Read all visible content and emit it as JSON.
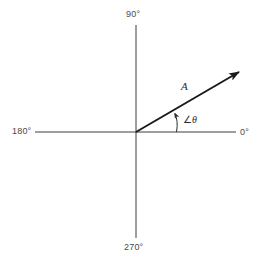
{
  "figure": {
    "name": "phasor-diagram",
    "background_color": "#ffffff",
    "width": 264,
    "height": 267
  },
  "axes": {
    "line_color": "#3d3d3d",
    "origin": {
      "x": 136,
      "y": 132
    },
    "vertical": {
      "x": 136,
      "y_top": 25,
      "y_bottom": 238
    },
    "horizontal": {
      "y": 132,
      "x_left": 35,
      "x_right": 236
    },
    "labels": {
      "top": "90°",
      "left": "180°",
      "right": "0°",
      "bottom": "270°"
    }
  },
  "vector": {
    "label": "A",
    "color": "#1a1a1a",
    "start": {
      "x": 136,
      "y": 132
    },
    "end": {
      "x": 245,
      "y": 68
    },
    "angle_degrees": 30,
    "has_arrowhead": true
  },
  "angle_annotation": {
    "label_prefix": "∠",
    "label_symbol": "θ",
    "label_full": "∠θ",
    "arc_color": "#2b2b2b",
    "arc_start": {
      "x": 174,
      "y": 132
    },
    "arc_end": {
      "x": 174,
      "y": 110
    },
    "has_arrowhead": true
  }
}
